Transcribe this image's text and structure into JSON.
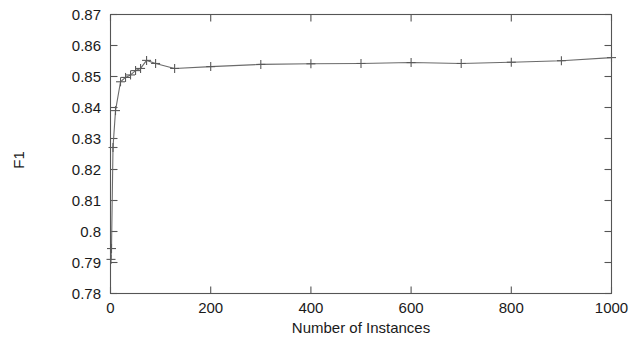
{
  "chart_data": {
    "type": "line",
    "title": "",
    "xlabel": "Number of Instances",
    "ylabel": "F1",
    "xlim": [
      0,
      1000
    ],
    "ylim": [
      0.78,
      0.87
    ],
    "grid": false,
    "legend": null,
    "marker_style": "plus",
    "line_color": "#6b6b6b",
    "xticks": [
      0,
      200,
      400,
      600,
      800,
      1000
    ],
    "xtick_labels": [
      "0",
      "200",
      "400",
      "600",
      "800",
      "1000"
    ],
    "yticks": [
      0.78,
      0.79,
      0.8,
      0.81,
      0.82,
      0.83,
      0.84,
      0.85,
      0.86,
      0.87
    ],
    "ytick_labels": [
      "0.78",
      "0.79",
      "0.8",
      "0.81",
      "0.82",
      "0.83",
      "0.84",
      "0.85",
      "0.86",
      "0.87"
    ],
    "x": [
      1,
      2,
      5,
      10,
      20,
      30,
      40,
      50,
      60,
      72,
      90,
      128,
      200,
      300,
      400,
      500,
      600,
      700,
      800,
      900,
      1000
    ],
    "values": [
      0.791,
      0.7945,
      0.8271,
      0.839,
      0.8483,
      0.8497,
      0.8505,
      0.8519,
      0.8526,
      0.8552,
      0.8542,
      0.8526,
      0.8532,
      0.8539,
      0.8541,
      0.8542,
      0.8545,
      0.8542,
      0.8546,
      0.8551,
      0.8561
    ],
    "series": [
      {
        "name": "F1",
        "values": [
          0.791,
          0.7945,
          0.8271,
          0.839,
          0.8483,
          0.8497,
          0.8505,
          0.8519,
          0.8526,
          0.8552,
          0.8542,
          0.8526,
          0.8532,
          0.8539,
          0.8541,
          0.8542,
          0.8545,
          0.8542,
          0.8546,
          0.8551,
          0.8561
        ]
      }
    ]
  }
}
